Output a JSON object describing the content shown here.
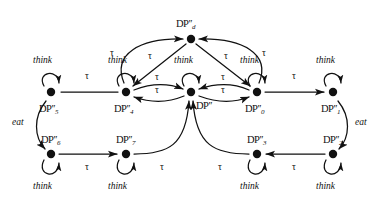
{
  "figure": {
    "type": "state-transition-diagram",
    "title": "",
    "background_color": "#ffffff",
    "stroke_color": "#111111",
    "node_color": "#111111",
    "width": 383,
    "height": 204
  },
  "nodes": [
    {
      "id": "d",
      "label_base": "DP",
      "label_primes": "′′",
      "label_sub": "d",
      "x": 191,
      "y": 39,
      "label_x": 176,
      "label_y": 19,
      "self_loop": false,
      "self_loop_label": ""
    },
    {
      "id": "n5",
      "label_base": "DP",
      "label_primes": "′′",
      "label_sub": "5",
      "x": 51,
      "y": 92,
      "label_x": 39,
      "label_y": 104,
      "self_loop": true,
      "self_loop_label": "think"
    },
    {
      "id": "n4",
      "label_base": "DP",
      "label_primes": "′′",
      "label_sub": "4",
      "x": 126,
      "y": 92,
      "label_x": 114,
      "label_y": 104,
      "self_loop": true,
      "self_loop_label": "think"
    },
    {
      "id": "nc",
      "label_base": "DP",
      "label_primes": "′′",
      "label_sub": "",
      "x": 191,
      "y": 92,
      "label_x": 196,
      "label_y": 101,
      "self_loop": true,
      "self_loop_label": "think"
    },
    {
      "id": "n0",
      "label_base": "DP",
      "label_primes": "′′",
      "label_sub": "0",
      "x": 257,
      "y": 92,
      "label_x": 245,
      "label_y": 104,
      "self_loop": true,
      "self_loop_label": "think"
    },
    {
      "id": "n1",
      "label_base": "DP",
      "label_primes": "′′",
      "label_sub": "1",
      "x": 333,
      "y": 92,
      "label_x": 321,
      "label_y": 104,
      "self_loop": true,
      "self_loop_label": "think"
    },
    {
      "id": "n6",
      "label_base": "DP",
      "label_primes": "′′",
      "label_sub": "6",
      "x": 51,
      "y": 154,
      "label_x": 41,
      "label_y": 139,
      "self_loop": true,
      "self_loop_label": "think"
    },
    {
      "id": "n7",
      "label_base": "DP",
      "label_primes": "′′",
      "label_sub": "7",
      "x": 126,
      "y": 154,
      "label_x": 116,
      "label_y": 139,
      "self_loop": true,
      "self_loop_label": "think"
    },
    {
      "id": "n3",
      "label_base": "DP",
      "label_primes": "′′",
      "label_sub": "3",
      "x": 257,
      "y": 154,
      "label_x": 247,
      "label_y": 139,
      "self_loop": true,
      "self_loop_label": "think"
    },
    {
      "id": "n2",
      "label_base": "DP",
      "label_primes": "′′",
      "label_sub": "2",
      "x": 333,
      "y": 154,
      "label_x": 323,
      "label_y": 139,
      "self_loop": true,
      "self_loop_label": "think"
    }
  ],
  "self_loop_labels": [
    {
      "for": "n5",
      "text": "think",
      "x": 33,
      "y": 62
    },
    {
      "for": "n4",
      "text": "think",
      "x": 108,
      "y": 62
    },
    {
      "for": "nc",
      "text": "think",
      "x": 174,
      "y": 62
    },
    {
      "for": "n0",
      "text": "think",
      "x": 240,
      "y": 62
    },
    {
      "for": "n1",
      "text": "think",
      "x": 316,
      "y": 62
    },
    {
      "for": "n6",
      "text": "think",
      "x": 33,
      "y": 182
    },
    {
      "for": "n7",
      "text": "think",
      "x": 108,
      "y": 182
    },
    {
      "for": "n3",
      "text": "think",
      "x": 240,
      "y": 182
    },
    {
      "for": "n2",
      "text": "think",
      "x": 316,
      "y": 182
    }
  ],
  "edges": [
    {
      "id": "e-4-to-5",
      "from": "n4",
      "to": "n5",
      "action": "tau",
      "label_x": 85,
      "label_y": 78
    },
    {
      "id": "e-4-to-c",
      "from": "n4",
      "to": "nc",
      "action": "tau",
      "label_x": 155,
      "label_y": 79
    },
    {
      "id": "e-c-to-4",
      "from": "nc",
      "to": "n4",
      "action": "tau",
      "label_x": 155,
      "label_y": 92
    },
    {
      "id": "e-c-to-0",
      "from": "nc",
      "to": "n0",
      "action": "tau",
      "label_x": 221,
      "label_y": 79
    },
    {
      "id": "e-0-to-c",
      "from": "n0",
      "to": "nc",
      "action": "tau",
      "label_x": 221,
      "label_y": 92
    },
    {
      "id": "e-0-to-1",
      "from": "n0",
      "to": "n1",
      "action": "tau",
      "label_x": 292,
      "label_y": 78
    },
    {
      "id": "e-4-to-d",
      "from": "n4",
      "to": "d",
      "action": "tau",
      "label_x": 113,
      "label_y": 55
    },
    {
      "id": "e-d-to-4",
      "from": "d",
      "to": "n4",
      "action": "tau",
      "label_x": 151,
      "label_y": 58
    },
    {
      "id": "e-0-to-d",
      "from": "n0",
      "to": "d",
      "action": "tau",
      "label_x": 262,
      "label_y": 55
    },
    {
      "id": "e-d-to-0",
      "from": "d",
      "to": "n0",
      "action": "tau",
      "label_x": 224,
      "label_y": 58
    },
    {
      "id": "e-5-to-6",
      "from": "n5",
      "to": "n6",
      "action": "eat",
      "label_x": 12,
      "label_y": 122
    },
    {
      "id": "e-1-to-2",
      "from": "n1",
      "to": "n2",
      "action": "eat",
      "label_x": 355,
      "label_y": 122
    },
    {
      "id": "e-6-to-7",
      "from": "n6",
      "to": "n7",
      "action": "tau",
      "label_x": 85,
      "label_y": 166
    },
    {
      "id": "e-7-to-c",
      "from": "n7",
      "to": "nc",
      "action": "tau",
      "label_x": 160,
      "label_y": 166
    },
    {
      "id": "e-3-to-c",
      "from": "n3",
      "to": "nc",
      "action": "tau",
      "label_x": 218,
      "label_y": 166
    },
    {
      "id": "e-2-to-3",
      "from": "n2",
      "to": "n3",
      "action": "tau",
      "label_x": 292,
      "label_y": 166
    }
  ],
  "actions": {
    "tau": "τ",
    "eat": "eat",
    "think": "think"
  }
}
